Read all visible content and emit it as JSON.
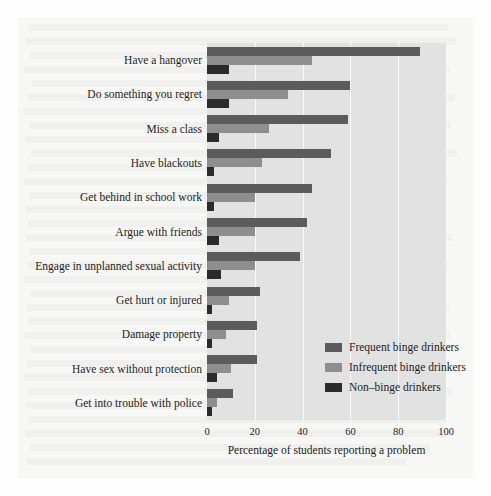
{
  "chart_data": {
    "type": "bar",
    "orientation": "horizontal",
    "title": "",
    "xlabel": "Percentage of students reporting a problem",
    "ylabel": "",
    "xlim": [
      0,
      100
    ],
    "xticks": [
      0,
      20,
      40,
      60,
      80,
      100
    ],
    "xtick_labels": [
      "0",
      "20",
      "40",
      "60",
      "80",
      "100"
    ],
    "grid": true,
    "grid_axis": "x",
    "legend_position": "lower right (inside plot)",
    "categories": [
      "Have a hangover",
      "Do something you regret",
      "Miss a class",
      "Have blackouts",
      "Get behind in school work",
      "Argue with friends",
      "Engage in unplanned sexual activity",
      "Get hurt or injured",
      "Damage property",
      "Have sex without protection",
      "Get into trouble with police"
    ],
    "series": [
      {
        "name": "Frequent binge drinkers",
        "color": "#5b5b5b",
        "values": [
          89,
          60,
          59,
          52,
          44,
          42,
          39,
          22,
          21,
          21,
          11
        ]
      },
      {
        "name": "Infrequent binge drinkers",
        "color": "#8e8e8e",
        "values": [
          44,
          34,
          26,
          23,
          20,
          20,
          20,
          9,
          8,
          10,
          4
        ]
      },
      {
        "name": "Non-binge drinkers",
        "color": "#2b2b2b",
        "values": [
          9,
          9,
          5,
          3,
          3,
          5,
          6,
          2,
          2,
          4,
          2
        ]
      }
    ]
  },
  "legend": {
    "entries": [
      {
        "label": "Frequent binge drinkers",
        "color": "#5b5b5b"
      },
      {
        "label": "Infrequent binge drinkers",
        "color": "#8e8e8e"
      },
      {
        "label": "Non–binge drinkers",
        "color": "#2b2b2b"
      }
    ]
  },
  "colors": {
    "plot_background": "#e2e2e2",
    "page_background": "#fdfdfd",
    "gridline": "#fafafa",
    "text": "#1d1d1d"
  }
}
